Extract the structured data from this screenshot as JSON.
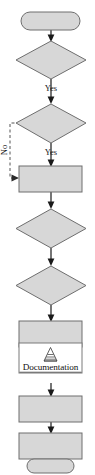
{
  "diagram": {
    "type": "flowchart",
    "orientation": "vertical",
    "canvas": {
      "width": 95,
      "height": 475
    },
    "palette": {
      "node_fill": "#d7d7d7",
      "node_stroke": "#6e6e6e",
      "white_node_fill": "#ffffff",
      "connector": "#1a1a1a",
      "dashed_connector": "#555555",
      "background": "#ffffff",
      "label_text": "#1a1a1a"
    },
    "nodes": [
      {
        "id": "start",
        "shape": "terminal",
        "label": ""
      },
      {
        "id": "dec1",
        "shape": "decision",
        "label": ""
      },
      {
        "id": "dec2",
        "shape": "decision",
        "label": ""
      },
      {
        "id": "proc1",
        "shape": "process",
        "label": ""
      },
      {
        "id": "dec3",
        "shape": "decision",
        "label": ""
      },
      {
        "id": "dec4",
        "shape": "decision",
        "label": ""
      },
      {
        "id": "proc2",
        "shape": "process",
        "label": ""
      },
      {
        "id": "doc",
        "shape": "documentation",
        "label": "Documentation",
        "icon": "cone-stack-icon"
      },
      {
        "id": "proc3",
        "shape": "process",
        "label": ""
      },
      {
        "id": "proc4",
        "shape": "process",
        "label": ""
      },
      {
        "id": "end",
        "shape": "terminal",
        "label": ""
      }
    ],
    "edges": [
      {
        "from": "start",
        "to": "dec1",
        "label": "",
        "style": "solid"
      },
      {
        "from": "dec1",
        "to": "dec2",
        "label": "Yes",
        "style": "solid"
      },
      {
        "from": "dec2",
        "to": "proc1",
        "label": "Yes",
        "style": "solid"
      },
      {
        "from": "dec2",
        "to": "proc1",
        "label": "No",
        "style": "dashed",
        "route": "left-bypass"
      },
      {
        "from": "proc1",
        "to": "dec3",
        "label": "",
        "style": "solid"
      },
      {
        "from": "dec3",
        "to": "dec4",
        "label": "",
        "style": "solid"
      },
      {
        "from": "dec4",
        "to": "proc2",
        "label": "",
        "style": "solid"
      },
      {
        "from": "proc2",
        "to": "doc",
        "label": "",
        "style": "solid"
      },
      {
        "from": "doc",
        "to": "proc3",
        "label": "",
        "style": "solid"
      },
      {
        "from": "proc3",
        "to": "proc4",
        "label": "",
        "style": "solid"
      },
      {
        "from": "proc4",
        "to": "end",
        "label": "",
        "style": "solid"
      }
    ],
    "edge_labels": {
      "yes_1": "Yes",
      "yes_2": "Yes",
      "no_1": "No"
    },
    "documentation_node": {
      "text": "Documentation",
      "icon_name": "cone-stack-icon"
    }
  }
}
